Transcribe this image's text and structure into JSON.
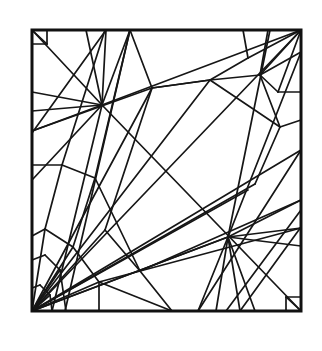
{
  "diagram": {
    "type": "crease-pattern",
    "stroke_color": "#161616",
    "background": "#ffffff",
    "frame": {
      "x1": 32,
      "y1": 30,
      "x2": 301,
      "y2": 311
    },
    "lines": [
      [
        32,
        311,
        301,
        30
      ],
      [
        32,
        30,
        102,
        105
      ],
      [
        102,
        105,
        301,
        311
      ],
      [
        47,
        30,
        47,
        44
      ],
      [
        32,
        44,
        47,
        44
      ],
      [
        286,
        311,
        286,
        297
      ],
      [
        286,
        297,
        301,
        297
      ],
      [
        32,
        30,
        47,
        44
      ],
      [
        286,
        297,
        301,
        311
      ],
      [
        86,
        30,
        102,
        105
      ],
      [
        106,
        30,
        102,
        105
      ],
      [
        130,
        30,
        102,
        105
      ],
      [
        32,
        92,
        102,
        105
      ],
      [
        32,
        111,
        102,
        105
      ],
      [
        32,
        131,
        102,
        105
      ],
      [
        106,
        30,
        32,
        133
      ],
      [
        130,
        30,
        65,
        311
      ],
      [
        102,
        105,
        52,
        311
      ],
      [
        102,
        105,
        301,
        30
      ],
      [
        32,
        131,
        152,
        88
      ],
      [
        152,
        88,
        210,
        80
      ],
      [
        152,
        88,
        130,
        30
      ],
      [
        210,
        80,
        248,
        58
      ],
      [
        248,
        58,
        243,
        30
      ],
      [
        248,
        58,
        301,
        30
      ],
      [
        210,
        80,
        280,
        127
      ],
      [
        210,
        80,
        260,
        75
      ],
      [
        260,
        75,
        301,
        30
      ],
      [
        260,
        75,
        268,
        30
      ],
      [
        260,
        75,
        301,
        52
      ],
      [
        260,
        75,
        278,
        92
      ],
      [
        278,
        92,
        301,
        30
      ],
      [
        278,
        92,
        301,
        92
      ],
      [
        260,
        75,
        280,
        127
      ],
      [
        280,
        127,
        301,
        120
      ],
      [
        32,
        311,
        255,
        184
      ],
      [
        32,
        311,
        210,
        80
      ],
      [
        152,
        88,
        105,
        230
      ],
      [
        105,
        230,
        140,
        271
      ],
      [
        255,
        184,
        280,
        127
      ],
      [
        210,
        80,
        152,
        88
      ],
      [
        228,
        237,
        301,
        200
      ],
      [
        228,
        237,
        301,
        228
      ],
      [
        228,
        237,
        301,
        246
      ],
      [
        228,
        237,
        270,
        30
      ],
      [
        228,
        237,
        301,
        52
      ],
      [
        228,
        237,
        198,
        311
      ],
      [
        228,
        237,
        216,
        311
      ],
      [
        228,
        237,
        240,
        311
      ],
      [
        228,
        237,
        255,
        311
      ],
      [
        301,
        150,
        198,
        311
      ],
      [
        301,
        210,
        226,
        311
      ],
      [
        301,
        227,
        240,
        311
      ],
      [
        32,
        311,
        228,
        237
      ],
      [
        32,
        311,
        248,
        190
      ],
      [
        32,
        311,
        301,
        150
      ],
      [
        228,
        237,
        32,
        311
      ],
      [
        102,
        105,
        32,
        180
      ],
      [
        62,
        165,
        32,
        165
      ],
      [
        62,
        165,
        95,
        178
      ],
      [
        95,
        178,
        140,
        271
      ],
      [
        62,
        165,
        105,
        30
      ],
      [
        95,
        178,
        130,
        30
      ],
      [
        32,
        236,
        45,
        229
      ],
      [
        45,
        229,
        73,
        247
      ],
      [
        73,
        247,
        99,
        282
      ],
      [
        99,
        282,
        99,
        311
      ],
      [
        32,
        260,
        45,
        255
      ],
      [
        45,
        255,
        60,
        270
      ],
      [
        60,
        270,
        66,
        311
      ],
      [
        32,
        288,
        40,
        285
      ],
      [
        40,
        285,
        50,
        295
      ],
      [
        50,
        295,
        52,
        311
      ],
      [
        32,
        311,
        45,
        229
      ],
      [
        32,
        311,
        73,
        247
      ],
      [
        32,
        311,
        99,
        282
      ],
      [
        32,
        311,
        60,
        270
      ],
      [
        32,
        311,
        50,
        295
      ],
      [
        45,
        229,
        62,
        165
      ],
      [
        73,
        247,
        95,
        178
      ],
      [
        140,
        271,
        172,
        311
      ],
      [
        140,
        271,
        301,
        200
      ],
      [
        99,
        282,
        172,
        311
      ],
      [
        99,
        282,
        301,
        228
      ],
      [
        32,
        311,
        152,
        88
      ],
      [
        32,
        311,
        105,
        230
      ]
    ]
  }
}
